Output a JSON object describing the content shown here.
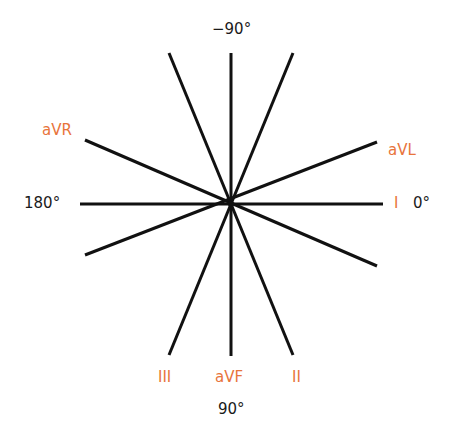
{
  "diagram": {
    "center": {
      "x": 231,
      "y": 204
    },
    "colors": {
      "line": "#111111",
      "lead_label": "#e8743b",
      "degree_label": "#1a1a1a"
    },
    "lines": [
      {
        "name": "lead-I-axis",
        "x1": 80,
        "y1": 204,
        "x2": 383,
        "y2": 204
      },
      {
        "name": "lead-aVF-axis",
        "x1": 231,
        "y1": 53,
        "x2": 231,
        "y2": 356
      },
      {
        "name": "lead-II-axis",
        "x1": 169,
        "y1": 53,
        "x2": 293,
        "y2": 355
      },
      {
        "name": "lead-III-axis",
        "x1": 293,
        "y1": 53,
        "x2": 169,
        "y2": 355
      },
      {
        "name": "lead-aVR-axis",
        "x1": 85,
        "y1": 140,
        "x2": 377,
        "y2": 266
      },
      {
        "name": "lead-aVL-axis",
        "x1": 377,
        "y1": 142,
        "x2": 85,
        "y2": 255
      }
    ],
    "lead_labels": [
      {
        "name": "aVR",
        "text": "aVR",
        "x": 42,
        "y": 121
      },
      {
        "name": "aVL",
        "text": "aVL",
        "x": 388,
        "y": 141
      },
      {
        "name": "I",
        "text": "I",
        "x": 394,
        "y": 194
      },
      {
        "name": "III",
        "text": "III",
        "x": 158,
        "y": 368
      },
      {
        "name": "aVF",
        "text": "aVF",
        "x": 215,
        "y": 368
      },
      {
        "name": "II",
        "text": "II",
        "x": 292,
        "y": 368
      }
    ],
    "degree_labels": [
      {
        "name": "minus-90",
        "text": "−90°",
        "x": 212,
        "y": 20
      },
      {
        "name": "180",
        "text": "180°",
        "x": 24,
        "y": 194
      },
      {
        "name": "0",
        "text": "0°",
        "x": 413,
        "y": 194
      },
      {
        "name": "90",
        "text": "90°",
        "x": 218,
        "y": 400
      }
    ]
  }
}
